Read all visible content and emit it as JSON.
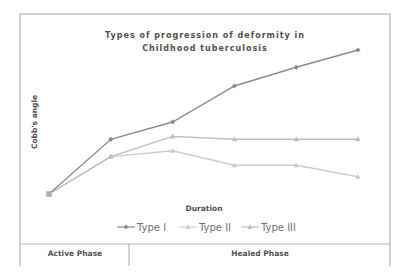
{
  "chart_data": {
    "type": "line",
    "title": "Types of progression of deformity in Childhood tuberculosis",
    "title_lines": [
      "Types of progression of deformity in",
      "Childhood tuberculosis"
    ],
    "xlabel": "Duration",
    "ylabel": "Cobb's angle",
    "x": [
      1,
      2,
      3,
      4,
      5,
      6
    ],
    "ylim": [
      0,
      10
    ],
    "grid": true,
    "legend_position": "bottom",
    "series": [
      {
        "name": "Type I",
        "marker": "diamond",
        "color": "#8c8c8c",
        "values": [
          0,
          3.8,
          5,
          7.5,
          8.8,
          10
        ]
      },
      {
        "name": "Type II",
        "marker": "triangle",
        "color": "#cccccc",
        "values": [
          0,
          2.6,
          3,
          2,
          2,
          1.2
        ]
      },
      {
        "name": "Type III",
        "marker": "triangle",
        "color": "#bdbdbd",
        "values": [
          0,
          2.6,
          4,
          3.8,
          3.8,
          3.8
        ]
      }
    ],
    "phases": [
      {
        "label": "Active Phase"
      },
      {
        "label": "Healed Phase"
      }
    ]
  }
}
